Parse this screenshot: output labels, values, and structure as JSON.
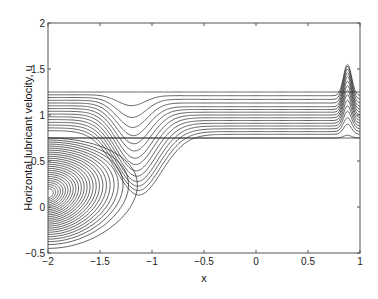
{
  "chart_data": {
    "type": "line",
    "title": "",
    "xlabel": "x",
    "ylabel": "Horizontal lubricant velocity, u",
    "xlim": [
      -2,
      1
    ],
    "ylim": [
      -0.5,
      2
    ],
    "xticks": [
      -2,
      -1.5,
      -1,
      -0.5,
      0,
      0.5,
      1
    ],
    "xtick_labels": [
      "-2",
      "-1.5",
      "-1",
      "-0.5",
      "0",
      "0.5",
      "1"
    ],
    "yticks": [
      -0.5,
      0,
      0.5,
      1,
      1.5,
      2
    ],
    "ytick_labels": [
      "-0.5",
      "0",
      "0.5",
      "1",
      "1.5",
      "2"
    ],
    "grid": false,
    "legend": null,
    "line_color": "#222222",
    "upper_series": [
      {
        "plateau": 1.25,
        "start": 1.25,
        "dip_depth": 0.0,
        "peak": 1.25
      },
      {
        "plateau": 1.21,
        "start": 1.22,
        "dip_depth": 0.12,
        "peak": 1.55
      },
      {
        "plateau": 1.17,
        "start": 1.19,
        "dip_depth": 0.22,
        "peak": 1.53
      },
      {
        "plateau": 1.13,
        "start": 1.16,
        "dip_depth": 0.3,
        "peak": 1.5
      },
      {
        "plateau": 1.09,
        "start": 1.13,
        "dip_depth": 0.36,
        "peak": 1.46
      },
      {
        "plateau": 1.06,
        "start": 1.1,
        "dip_depth": 0.42,
        "peak": 1.42
      },
      {
        "plateau": 1.03,
        "start": 1.07,
        "dip_depth": 0.47,
        "peak": 1.37
      },
      {
        "plateau": 1.0,
        "start": 1.04,
        "dip_depth": 0.52,
        "peak": 1.32
      },
      {
        "plateau": 0.97,
        "start": 1.01,
        "dip_depth": 0.56,
        "peak": 1.27
      },
      {
        "plateau": 0.94,
        "start": 0.98,
        "dip_depth": 0.6,
        "peak": 1.22
      },
      {
        "plateau": 0.91,
        "start": 0.95,
        "dip_depth": 0.63,
        "peak": 1.16
      },
      {
        "plateau": 0.88,
        "start": 0.92,
        "dip_depth": 0.66,
        "peak": 1.1
      },
      {
        "plateau": 0.85,
        "start": 0.89,
        "dip_depth": 0.68,
        "peak": 1.04
      },
      {
        "plateau": 0.82,
        "start": 0.86,
        "dip_depth": 0.7,
        "peak": 0.97
      },
      {
        "plateau": 0.79,
        "start": 0.83,
        "dip_depth": 0.72,
        "peak": 0.9
      },
      {
        "plateau": 0.75,
        "start": 0.75,
        "dip_depth": 0.0,
        "peak": 0.78
      }
    ],
    "lower_loops": {
      "count": 26,
      "x_origin": -2.0,
      "center_u": 0.15,
      "max_extent_x": -1.2,
      "u_top_range": [
        0.75,
        0.2
      ],
      "u_bottom_range": [
        -0.45,
        0.1
      ]
    },
    "peak_location_x": 0.88,
    "dip_location_x": -1.2,
    "transition_x": -1.0
  },
  "figure": {
    "width": 378,
    "height": 299,
    "axes_px": {
      "left": 48,
      "right": 360,
      "top": 23,
      "bottom": 253
    }
  }
}
